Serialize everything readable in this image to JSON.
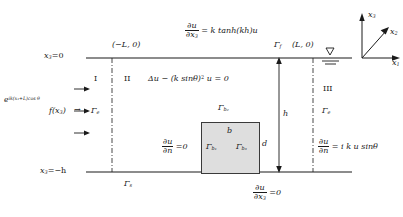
{
  "figure": {
    "type": "schematic-diagram",
    "colors": {
      "line": "#1a1a1a",
      "obstacle_fill": "#dedede",
      "obstacle_stroke": "#3a3a3a",
      "background": "#ffffff"
    }
  },
  "axes": {
    "x1_label": "x",
    "x1_sub": "1",
    "x2_label": "x",
    "x2_sub": "2",
    "x3_label": "x",
    "x3_sub": "3"
  },
  "surface": {
    "free_surface_condition": {
      "num": "∂u",
      "den_prefix": "∂x",
      "den_sub": "3",
      "rhs": "= k tanh(kh)u"
    },
    "gamma_f": "Γ",
    "gamma_f_sub": "f",
    "left_corner": "(−L, 0)",
    "right_corner": "(L, 0)",
    "x3_top_label": "x",
    "x3_top_sub": "3",
    "x3_top_value": "=0"
  },
  "bottom": {
    "x3_bottom_label": "x",
    "x3_bottom_sub": "3",
    "x3_bottom_value": "=−h",
    "gamma_s": "Γ",
    "gamma_s_sub": "s",
    "bottom_condition": {
      "num": "∂u",
      "den_prefix": "∂x",
      "den_sub": "3",
      "rhs": "=0"
    }
  },
  "regions": {
    "region_I": "I",
    "region_II": "II",
    "region_III": "III",
    "governing_equation": {
      "lhs": "Δu − (k sinθ)",
      "exponent": "2",
      "rhs": " u = 0"
    }
  },
  "incident": {
    "incident_wave": "e",
    "incident_exponent": "ik(x₁+L)cos θ",
    "forcing": "f(x",
    "forcing_sub": "3",
    "forcing_close": ")",
    "arrow": "→",
    "gamma_e_left": "Γ",
    "gamma_e_left_sub": "e"
  },
  "right_boundary": {
    "gamma_e_right": "Γ",
    "gamma_e_right_sub": "e",
    "radiation_condition": {
      "num": "∂u",
      "den": "∂n",
      "rhs": "= i k u sinθ"
    }
  },
  "obstacle": {
    "width_label": "b",
    "height_label": "d",
    "gamma_b1": "Γ",
    "gamma_b1_sub": "b₁",
    "gamma_b2": "Γ",
    "gamma_b2_sub": "b₂",
    "gamma_b3": "Γ",
    "gamma_b3_sub": "b₃",
    "neumann_condition": {
      "num": "∂u",
      "den": "∂n",
      "rhs": "=0"
    }
  },
  "depth": {
    "h_label": "h"
  }
}
